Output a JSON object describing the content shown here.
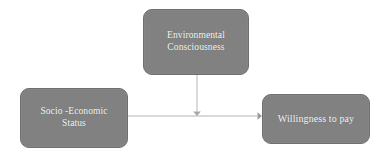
{
  "diagram": {
    "canvas": {
      "width": 382,
      "height": 164,
      "background_color": "#ffffff"
    },
    "style": {
      "node_fill_color": "#818181",
      "node_border_color": "#6f6f6f",
      "node_text_color": "#f4f4f4",
      "connector_color": "#b4b4b4"
    },
    "nodes": [
      {
        "id": "environmental-consciousness",
        "label": "Environmental Consciousness",
        "line1": "Environmental",
        "line2": "Consciousness",
        "x": 143,
        "y": 9,
        "width": 106,
        "height": 66
      },
      {
        "id": "socio-economic-status",
        "label": "Socio -Economic Status",
        "line1": "Socio -Economic",
        "line2": "Status",
        "x": 20,
        "y": 88,
        "width": 108,
        "height": 60
      },
      {
        "id": "willingness-to-pay",
        "label": "Willingness to pay",
        "line1": "Willingness to pay",
        "line2": "",
        "x": 262,
        "y": 94,
        "width": 108,
        "height": 50
      }
    ],
    "connectors": [
      {
        "id": "socio-economic-status-to-willingness-to-pay",
        "from": "socio-economic-status",
        "to": "willingness-to-pay",
        "orientation": "horizontal",
        "arrowhead": "right",
        "x1": 128,
        "y1": 116,
        "x2": 262,
        "y2": 116
      },
      {
        "id": "environmental-consciousness-to-path",
        "from": "environmental-consciousness",
        "to": "socio-economic-status-to-willingness-to-pay",
        "orientation": "vertical",
        "arrowhead": "down",
        "x1": 197,
        "y1": 75,
        "x2": 197,
        "y2": 116
      }
    ]
  }
}
